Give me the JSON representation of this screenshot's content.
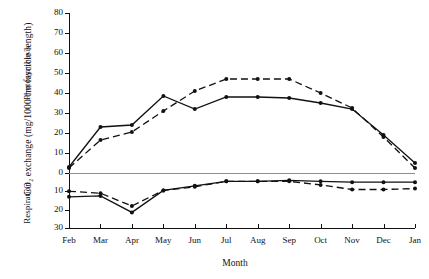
{
  "chart_data": {
    "type": "line",
    "title": "",
    "ylabel": "CO₂ exchange (mg/1000 cm fascicle length)",
    "xlabel": "Month",
    "panel_labels": {
      "upper": "Photosynthesis",
      "lower": "Respiration"
    },
    "categories": [
      "Feb",
      "Mar",
      "Apr",
      "May",
      "Jun",
      "Jul",
      "Aug",
      "Sep",
      "Oct",
      "Nov",
      "Dec",
      "Jan"
    ],
    "upper_axis": {
      "ticks": [
        80,
        70,
        60,
        50,
        40,
        30,
        20,
        10,
        0
      ],
      "ylim": [
        0,
        80
      ],
      "grid": false
    },
    "lower_axis": {
      "ticks": [
        0,
        10,
        20,
        30
      ],
      "ylim": [
        0,
        30
      ],
      "grid": false,
      "note": "values plotted downward from zero line"
    },
    "legend": {
      "position": "none",
      "entries": []
    },
    "series": [
      {
        "name": "photosynthesis-solid",
        "panel": "upper",
        "style": "solid",
        "marker": "filled-circle",
        "values": [
          3,
          23,
          24,
          38.5,
          32,
          38,
          38,
          37.5,
          35,
          32,
          19,
          5
        ]
      },
      {
        "name": "photosynthesis-dashed",
        "panel": "upper",
        "style": "dashed",
        "marker": "filled-circle",
        "values": [
          2.5,
          16.5,
          20.5,
          31,
          41,
          47,
          47,
          47,
          40,
          32.5,
          18,
          2.5
        ]
      },
      {
        "name": "respiration-solid",
        "panel": "lower",
        "style": "solid",
        "marker": "filled-circle",
        "values": [
          13,
          12.5,
          21.5,
          9.5,
          7,
          4.5,
          4.5,
          4,
          4.5,
          5,
          5,
          5
        ]
      },
      {
        "name": "respiration-dashed",
        "panel": "lower",
        "style": "dashed",
        "marker": "filled-circle",
        "values": [
          10,
          11,
          18,
          9.5,
          7.5,
          4.5,
          4.5,
          4.5,
          6.5,
          9,
          9,
          8.5
        ]
      }
    ]
  }
}
